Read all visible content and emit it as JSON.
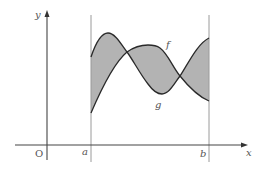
{
  "diagram": {
    "type": "area-between-curves",
    "axes": {
      "x_label": "x",
      "y_label": "y",
      "origin_label": "O"
    },
    "bounds": {
      "left_label": "a",
      "right_label": "b"
    },
    "curves": [
      {
        "name": "f",
        "label": "f"
      },
      {
        "name": "g",
        "label": "g"
      }
    ],
    "colors": {
      "fill": "#b3b3b3",
      "curve_stroke": "#2a2a2a",
      "axis_stroke": "#444444",
      "bound_stroke": "#9a9a9a"
    }
  }
}
